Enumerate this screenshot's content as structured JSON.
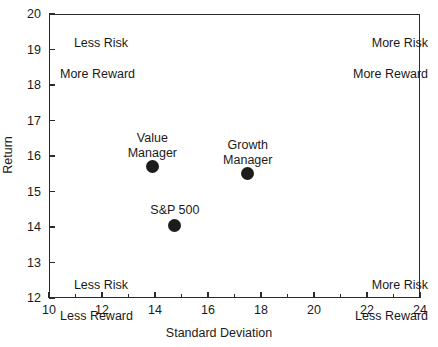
{
  "chart_data": {
    "type": "scatter",
    "title": "",
    "xlabel": "Standard Deviation",
    "ylabel": "Return",
    "xlim": [
      10,
      24
    ],
    "ylim": [
      12,
      20
    ],
    "x_ticks": [
      10,
      12,
      14,
      16,
      18,
      20,
      22,
      24
    ],
    "y_ticks": [
      12,
      13,
      14,
      15,
      16,
      17,
      18,
      19,
      20
    ],
    "x_minor_ticks": [
      11,
      13,
      15,
      17,
      19,
      21,
      23
    ],
    "grid": false,
    "legend": "none",
    "marker_color": "#1c1c1c",
    "points": [
      {
        "name": "Value Manager",
        "label_line1": "Value",
        "label_line2": "Manager",
        "x": 13.9,
        "y": 15.7
      },
      {
        "name": "Growth Manager",
        "label_line1": "Growth",
        "label_line2": "Manager",
        "x": 17.5,
        "y": 15.5
      },
      {
        "name": "S&P 500",
        "label_line1": "S&P 500",
        "label_line2": "",
        "x": 14.75,
        "y": 14.05
      }
    ],
    "annotations": [
      {
        "position": "top-left",
        "line1": "Less Risk",
        "line2": "More Reward"
      },
      {
        "position": "top-right",
        "line1": "More Risk",
        "line2": "More Reward"
      },
      {
        "position": "bottom-left",
        "line1": "Less Risk",
        "line2": "Less Reward"
      },
      {
        "position": "bottom-right",
        "line1": "More Risk",
        "line2": "Less Reward"
      }
    ]
  },
  "axes": {
    "x_title": "Standard Deviation",
    "y_title": "Return",
    "x_tick_labels": [
      "10",
      "12",
      "14",
      "16",
      "18",
      "20",
      "22",
      "24"
    ],
    "y_tick_labels": [
      "12",
      "13",
      "14",
      "15",
      "16",
      "17",
      "18",
      "19",
      "20"
    ]
  },
  "annotations": {
    "top_left": {
      "line1": "Less Risk",
      "line2": "More Reward"
    },
    "top_right": {
      "line1": "More Risk",
      "line2": "More Reward"
    },
    "bottom_left": {
      "line1": "Less Risk",
      "line2": "Less Reward"
    },
    "bottom_right": {
      "line1": "More Risk",
      "line2": "Less Reward"
    }
  },
  "points": {
    "value": {
      "line1": "Value",
      "line2": "Manager"
    },
    "growth": {
      "line1": "Growth",
      "line2": "Manager"
    },
    "sp500": {
      "line1": "S&P 500",
      "line2": ""
    }
  }
}
